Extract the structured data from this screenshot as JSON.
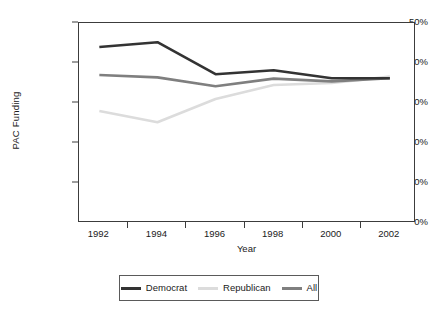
{
  "chart_data": {
    "type": "line",
    "title": "",
    "xlabel": "Year",
    "ylabel": "PAC Funding",
    "x": [
      1992,
      1994,
      1996,
      1998,
      2000,
      2002
    ],
    "xtick_labels": [
      "1992",
      "1994",
      "1996",
      "1998",
      "2000",
      "2002"
    ],
    "ytick_labels": [
      "0%",
      "10%",
      "20%",
      "30%",
      "40%",
      "50%"
    ],
    "ytick_values": [
      0,
      10,
      20,
      30,
      40,
      50
    ],
    "ylim": [
      0,
      50
    ],
    "xlim": [
      1991.3,
      2002.9
    ],
    "grid": false,
    "legend_position": "below-center",
    "series": [
      {
        "name": "Democrat",
        "color": "#333333",
        "values": [
          44.0,
          45.2,
          37.2,
          38.2,
          36.2,
          36.2
        ]
      },
      {
        "name": "Republican",
        "color": "#dcdcdc",
        "values": [
          28.0,
          25.2,
          31.0,
          34.5,
          35.0,
          36.6
        ]
      },
      {
        "name": "All",
        "color": "#7f7f7f",
        "values": [
          37.0,
          36.4,
          34.2,
          36.1,
          35.4,
          36.2
        ]
      }
    ]
  },
  "legend": {
    "entries": [
      {
        "label": "Democrat",
        "color": "#333333"
      },
      {
        "label": "Republican",
        "color": "#dcdcdc"
      },
      {
        "label": "All",
        "color": "#7f7f7f"
      }
    ]
  },
  "axes": {
    "x_title": "Year",
    "y_title": "PAC Funding"
  }
}
